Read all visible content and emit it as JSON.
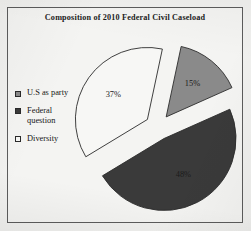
{
  "figure": {
    "title": "Composition of 2010 Federal Civil Caseload",
    "background_color": "#f1f1ef",
    "frame_color": "#5c5c5c"
  },
  "legend": {
    "position": "left",
    "items": [
      {
        "label": "U.S as party",
        "color": "#8a8a8a",
        "border": "#2a2a2a"
      },
      {
        "label": "Federal\nquestion",
        "color": "#3a3a3a",
        "border": "#2a2a2a"
      },
      {
        "label": "Diversity",
        "color": "#f7f7f5",
        "border": "#2a2a2a"
      }
    ]
  },
  "chart_data": {
    "type": "pie",
    "title": "Composition of 2010 Federal Civil Caseload",
    "xlabel": "",
    "ylabel": "",
    "exploded": true,
    "legend_position": "left",
    "grid": false,
    "categories": [
      "U.S as party",
      "Federal question",
      "Diversity"
    ],
    "values": [
      15,
      48,
      37
    ],
    "labels": [
      "15%",
      "48%",
      "37%"
    ],
    "colors": [
      "#8a8a8a",
      "#3a3a3a",
      "#f7f7f5"
    ],
    "label_text_colors": [
      "#1a1a1a",
      "#1a1a1a",
      "#1a1a1a"
    ],
    "units": "percent",
    "total": 100
  }
}
